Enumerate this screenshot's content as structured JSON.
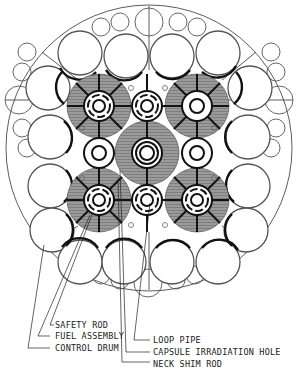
{
  "diagram": {
    "type": "reactor-core-cross-section",
    "labels": {
      "safety_rod": "SAFETY ROD",
      "fuel_assembly": "FUEL ASSEMBLY",
      "control_drum": "CONTROL DRUM",
      "loop_pipe": "LOOP PIPE",
      "capsule_irradiation_hole": "CAPSULE IRRADIATION HOLE",
      "neck_shim_rod": "NECK SHIM ROD"
    },
    "colors": {
      "line": "#222222",
      "fuel_fill": "#8a8a8a",
      "background": "#ffffff"
    }
  }
}
